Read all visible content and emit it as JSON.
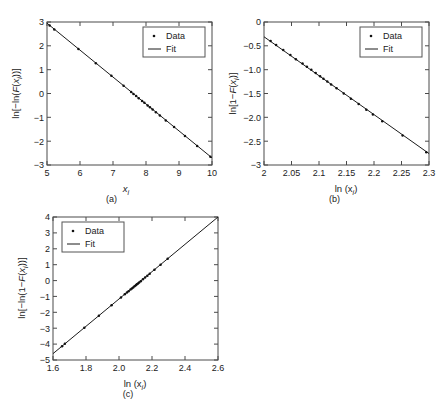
{
  "figure": {
    "panel_count": 3,
    "background": "#ffffff",
    "line_color": "#1a1a1a",
    "marker_color": "#111111",
    "axis_color": "#4a4a4a"
  },
  "legend": {
    "data_label": "Data",
    "fit_label": "Fit",
    "data_marker": "dot-marker",
    "fit_marker": "line-marker"
  },
  "chart_data": [
    {
      "type": "scatter",
      "panel": "a",
      "caption": "(a)",
      "title": "",
      "xlabel": "x_i",
      "xlabel_display": "x",
      "xlabel_sub": "i",
      "ylabel": "ln[-ln(F(x_i))]",
      "ylabel_parts": [
        "ln[−ln(",
        "F",
        "(",
        "x",
        "i",
        "))]"
      ],
      "xlim": [
        5,
        10
      ],
      "ylim": [
        -3,
        3
      ],
      "xticks": [
        5,
        6,
        7,
        8,
        9,
        10
      ],
      "xtick_labels": [
        "5",
        "6",
        "7",
        "8",
        "9",
        "10"
      ],
      "yticks": [
        -3,
        -2,
        -1,
        0,
        1,
        2,
        3
      ],
      "ytick_labels": [
        "−3",
        "−2",
        "−1",
        "0",
        "1",
        "2",
        "3"
      ],
      "grid": false,
      "legend_position": "top-right",
      "series": [
        {
          "name": "Fit",
          "type": "line",
          "x": [
            5.0,
            10.0
          ],
          "y": [
            2.95,
            -2.7
          ]
        },
        {
          "name": "Data",
          "type": "scatter",
          "x": [
            5.08,
            5.22,
            5.95,
            6.48,
            6.95,
            7.32,
            7.55,
            7.62,
            7.7,
            7.78,
            7.88,
            7.95,
            8.05,
            8.12,
            8.2,
            8.3,
            8.42,
            8.6,
            8.85,
            9.18,
            9.55,
            9.95
          ],
          "y": [
            2.85,
            2.69,
            1.87,
            1.27,
            0.74,
            0.32,
            0.06,
            -0.02,
            -0.11,
            -0.2,
            -0.31,
            -0.39,
            -0.5,
            -0.58,
            -0.67,
            -0.79,
            -0.92,
            -1.13,
            -1.41,
            -1.78,
            -2.2,
            -2.65
          ]
        }
      ]
    },
    {
      "type": "scatter",
      "panel": "b",
      "caption": "(b)",
      "title": "",
      "xlabel": "ln (x_i)",
      "xlabel_display": "ln (x",
      "xlabel_sub": "i",
      "xlabel_tail": ")",
      "ylabel": "ln[1-F(x_i)]",
      "xlim": [
        2,
        2.3
      ],
      "ylim": [
        -3,
        0
      ],
      "xticks": [
        2,
        2.05,
        2.1,
        2.15,
        2.2,
        2.25,
        2.3
      ],
      "xtick_labels": [
        "2",
        "2.05",
        "2.1",
        "2.15",
        "2.2",
        "2.25",
        "2.3"
      ],
      "yticks": [
        -3,
        -2.5,
        -2.0,
        -1.5,
        -1.0,
        -0.5,
        0
      ],
      "ytick_labels": [
        "−3",
        "−2.5",
        "−2.0",
        "−1.5",
        "−1.0",
        "−0.5",
        "0"
      ],
      "grid": false,
      "legend_position": "top-right",
      "series": [
        {
          "name": "Fit",
          "type": "line",
          "x": [
            2.0,
            2.3
          ],
          "y": [
            -0.31,
            -2.76
          ]
        },
        {
          "name": "Data",
          "type": "scatter",
          "x": [
            2.012,
            2.022,
            2.035,
            2.048,
            2.058,
            2.07,
            2.078,
            2.086,
            2.094,
            2.102,
            2.108,
            2.115,
            2.122,
            2.132,
            2.145,
            2.158,
            2.172,
            2.186,
            2.198,
            2.215,
            2.252,
            2.295
          ],
          "y": [
            -0.4,
            -0.48,
            -0.59,
            -0.69,
            -0.78,
            -0.87,
            -0.94,
            -1.0,
            -1.07,
            -1.14,
            -1.19,
            -1.25,
            -1.31,
            -1.39,
            -1.5,
            -1.61,
            -1.72,
            -1.84,
            -1.94,
            -2.08,
            -2.38,
            -2.73
          ]
        }
      ]
    },
    {
      "type": "scatter",
      "panel": "c",
      "caption": "(c)",
      "title": "",
      "xlabel": "ln (x_i)",
      "xlabel_display": "ln (x",
      "xlabel_sub": "i",
      "xlabel_tail": ")",
      "ylabel": "ln[-ln(1-F(x_i))]",
      "xlim": [
        1.6,
        2.6
      ],
      "ylim": [
        -5,
        4
      ],
      "xticks": [
        1.6,
        1.8,
        2.0,
        2.2,
        2.4,
        2.6
      ],
      "xtick_labels": [
        "1.6",
        "1.8",
        "2.0",
        "2.2",
        "2.4",
        "2.6"
      ],
      "yticks": [
        -5,
        -4,
        -3,
        -2,
        -1,
        0,
        1,
        2,
        3,
        4
      ],
      "ytick_labels": [
        "−5",
        "−4",
        "−3",
        "−2",
        "−1",
        "0",
        "1",
        "2",
        "3",
        "4"
      ],
      "grid": false,
      "legend_position": "top-left",
      "series": [
        {
          "name": "Fit",
          "type": "line",
          "x": [
            1.6,
            2.6
          ],
          "y": [
            -4.6,
            4.0
          ]
        },
        {
          "name": "Data",
          "type": "scatter",
          "x": [
            1.655,
            1.672,
            1.79,
            1.878,
            1.955,
            2.012,
            2.035,
            2.048,
            2.058,
            2.07,
            2.078,
            2.086,
            2.094,
            2.102,
            2.108,
            2.115,
            2.122,
            2.132,
            2.145,
            2.158,
            2.172,
            2.186,
            2.215,
            2.252,
            2.295
          ],
          "y": [
            -4.13,
            -3.98,
            -2.97,
            -2.21,
            -1.55,
            -1.06,
            -0.86,
            -0.75,
            -0.67,
            -0.56,
            -0.5,
            -0.43,
            -0.36,
            -0.29,
            -0.24,
            -0.18,
            -0.12,
            -0.04,
            0.08,
            0.19,
            0.31,
            0.43,
            0.68,
            1.0,
            1.37
          ]
        }
      ]
    }
  ]
}
